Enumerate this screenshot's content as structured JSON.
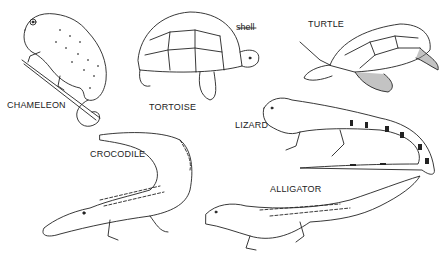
{
  "diagram": {
    "animals": [
      {
        "id": "chameleon",
        "label": "CHAMELEON"
      },
      {
        "id": "tortoise",
        "label": "TORTOISE",
        "callouts": [
          {
            "label": "shell"
          }
        ]
      },
      {
        "id": "turtle",
        "label": "TURTLE"
      },
      {
        "id": "lizard",
        "label": "LIZARD"
      },
      {
        "id": "crocodile",
        "label": "CROCODILE"
      },
      {
        "id": "alligator",
        "label": "ALLIGATOR"
      }
    ]
  }
}
